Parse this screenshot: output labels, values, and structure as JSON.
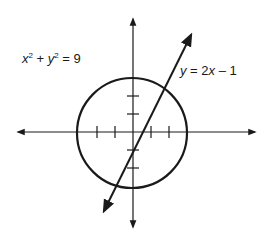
{
  "diagram": {
    "type": "coordinate-plane-graph",
    "circle_equation": {
      "var_x": "x",
      "exp_x": "2",
      "plus": " + ",
      "var_y": "y",
      "exp_y": "2",
      "rhs": " = 9"
    },
    "line_equation": {
      "lhs": "y",
      "eq": " = 2",
      "var": "x",
      "rest": " – 1"
    },
    "circle": {
      "center": [
        0,
        0
      ],
      "radius": 3
    },
    "line": {
      "slope": 2,
      "intercept": -1
    },
    "tick_marks": {
      "x": [
        -2,
        -1,
        1,
        2
      ],
      "y": [
        -2,
        -1,
        1,
        2
      ]
    },
    "colors": {
      "ink": "#1a1a1a",
      "background": "#ffffff"
    }
  }
}
